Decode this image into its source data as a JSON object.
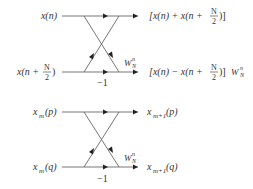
{
  "diagrams": [
    {
      "name": "dif-butterfly",
      "inputs": {
        "top": {
          "base": "x(n)"
        },
        "bottom": {
          "base": "x(n + ",
          "frac_num": "N",
          "frac_den": "2",
          "close": ")"
        }
      },
      "outputs": {
        "top": {
          "open": "[x(n) + x(n + ",
          "frac_num": "N",
          "frac_den": "2",
          "close": ")]"
        },
        "bottom": {
          "open": "[x(n) − x(n + ",
          "frac_num": "N",
          "frac_den": "2",
          "close": ")]",
          "twiddle": "W",
          "twiddle_sup": "n",
          "twiddle_sub": "N"
        }
      },
      "branch_gain": "−1",
      "twiddle": {
        "base": "W",
        "sup": "n",
        "sub": "N"
      }
    },
    {
      "name": "generic-butterfly",
      "inputs": {
        "top": {
          "base": "x",
          "sub": "m",
          "arg": "(p)"
        },
        "bottom": {
          "base": "x",
          "sub": "m",
          "arg": "(q)"
        }
      },
      "outputs": {
        "top": {
          "base": "x",
          "sub": "m+1",
          "arg": "(p)"
        },
        "bottom": {
          "base": "x",
          "sub": "m+1",
          "arg": "(q)"
        }
      },
      "branch_gain": "−1",
      "twiddle": {
        "base": "W",
        "sup": "n",
        "sub": "N"
      }
    }
  ]
}
